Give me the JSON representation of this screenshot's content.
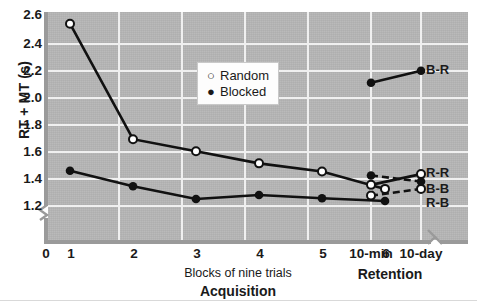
{
  "chart_data": {
    "type": "line",
    "title": "",
    "ylabel": "RT + MT (s)",
    "ylim": [
      1.1,
      2.65
    ],
    "yticks": [
      2.6,
      2.4,
      2.2,
      2.0,
      1.8,
      1.6,
      1.4,
      1.2
    ],
    "ytick_labels": [
      "2.6",
      "2.4",
      "2.2",
      "2.0",
      "1.8",
      "1.6",
      "1.4",
      "1.2"
    ],
    "grid": true,
    "legend_position": "upper-center",
    "legend": [
      {
        "label": "Random",
        "marker": "open-circle"
      },
      {
        "label": "Blocked",
        "marker": "filled-circle"
      }
    ],
    "panels": [
      {
        "name": "Acquisition",
        "xlabel": "Blocks of nine trials",
        "xticks": [
          0,
          1,
          2,
          3,
          4,
          5,
          6
        ],
        "xtick_labels": [
          "0",
          "1",
          "2",
          "3",
          "4",
          "5",
          "6"
        ],
        "series": [
          {
            "name": "Random",
            "marker": "open-circle",
            "line": "solid",
            "x": [
              1,
              2,
              3,
              4,
              5,
              6
            ],
            "values": [
              2.55,
              1.69,
              1.6,
              1.51,
              1.45,
              1.32
            ]
          },
          {
            "name": "Blocked",
            "marker": "filled-circle",
            "line": "solid",
            "x": [
              1,
              2,
              3,
              4,
              5,
              6
            ],
            "values": [
              1.455,
              1.34,
              1.245,
              1.275,
              1.25,
              1.23
            ]
          }
        ]
      },
      {
        "name": "Retention",
        "xlabel": "Retention",
        "xticks": [
          "10-min",
          "10-day"
        ],
        "xtick_labels": [
          "10-min",
          "10-day"
        ],
        "series": [
          {
            "name": "B-R",
            "marker": "filled-circle",
            "line": "solid",
            "categories": [
              "10-min",
              "10-day"
            ],
            "values": [
              2.11,
              2.2
            ],
            "label": "B-R"
          },
          {
            "name": "R-R",
            "marker": "open-circle",
            "line": "solid",
            "categories": [
              "10-min",
              "10-day"
            ],
            "values": [
              1.35,
              1.43
            ],
            "label": "R-R"
          },
          {
            "name": "B-B",
            "marker": "filled-circle",
            "line": "dashed",
            "categories": [
              "10-min",
              "10-day"
            ],
            "values": [
              1.42,
              1.375
            ],
            "label": "B-B"
          },
          {
            "name": "R-B",
            "marker": "open-circle",
            "line": "dashed",
            "categories": [
              "10-min",
              "10-day"
            ],
            "values": [
              1.27,
              1.32
            ],
            "label": "R-B"
          }
        ]
      }
    ],
    "colors": {
      "plot_background": "#b5b5b5",
      "gridline": "#f0f0f0",
      "axis": "#9a9a9a",
      "series_line": "#111111",
      "marker_fill_open": "#ffffff",
      "marker_fill_closed": "#111111",
      "figure_background": "#ffffff"
    },
    "annotations": [
      "axis break on y-axis below 1.2",
      "axis break on x-axis between Acquisition and Retention panels"
    ]
  },
  "yticks": {
    "t0": "2.6",
    "t1": "2.4",
    "t2": "2.2",
    "t3": "2.0",
    "t4": "1.8",
    "t5": "1.6",
    "t6": "1.4",
    "t7": "1.2"
  },
  "xticks": {
    "t0": "0",
    "t1": "1",
    "t2": "2",
    "t3": "3",
    "t4": "4",
    "t5": "5",
    "t6": "6",
    "r0": "10-min",
    "r1": "10-day"
  },
  "labels": {
    "ylabel": "RT + MT (s)",
    "acq_sub": "Blocks of nine trials",
    "acq_title": "Acquisition",
    "ret_title": "Retention",
    "legend_random": "Random",
    "legend_blocked": "Blocked",
    "legend_random_mark": "○",
    "legend_blocked_mark": "●",
    "pt_br": "B-R",
    "pt_rr": "R-R",
    "pt_bb": "B-B",
    "pt_rb": "R-B"
  }
}
